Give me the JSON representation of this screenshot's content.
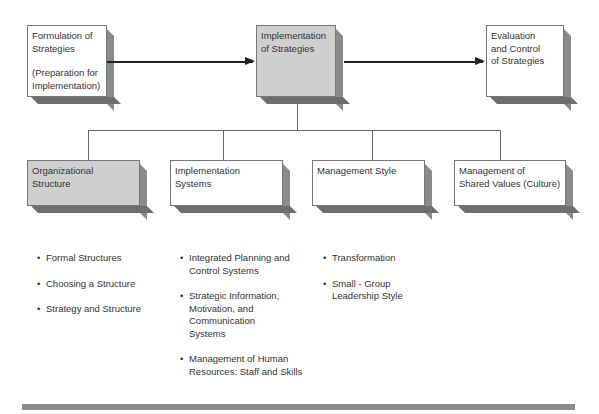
{
  "diagram": {
    "top_row": [
      {
        "id": "formulation",
        "title": "Formulation of\nStrategies",
        "subtitle": "(Preparation for\nImplementation)",
        "fill": "white"
      },
      {
        "id": "implementation",
        "title": "Implementation\nof Strategies",
        "fill": "gray"
      },
      {
        "id": "evaluation",
        "title": "Evaluation\nand Control\nof Strategies",
        "fill": "white"
      }
    ],
    "arrows": [
      {
        "from": "formulation",
        "to": "implementation"
      },
      {
        "from": "implementation",
        "to": "evaluation"
      }
    ],
    "children": [
      {
        "id": "organizational-structure",
        "title": "Organizational\nStructure",
        "fill": "gray",
        "bullets": [
          "Formal Structures",
          "Choosing a Structure",
          "Strategy and Structure"
        ]
      },
      {
        "id": "implementation-systems",
        "title": "Implementation\nSystems",
        "fill": "white",
        "bullets": [
          "Integrated Planning and\nControl Systems",
          "Strategic Information,\nMotivation, and\nCommunication\nSystems",
          "Management of Human\nResources:  Staff and Skills"
        ]
      },
      {
        "id": "management-style",
        "title": "Management Style",
        "fill": "white",
        "bullets": [
          "Transformation",
          "Small - Group\nLeadership Style"
        ]
      },
      {
        "id": "shared-values",
        "title": "Management of\nShared Values (Culture)",
        "fill": "white",
        "bullets": []
      }
    ],
    "colors": {
      "box_gray": "#cfcfcf",
      "shadow": "#8a8a8a",
      "bar": "#8c8c8c",
      "arrow": "#222222"
    }
  }
}
